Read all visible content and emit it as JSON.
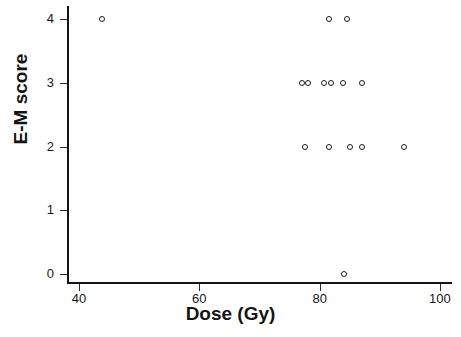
{
  "chart_data": {
    "type": "scatter",
    "title": "",
    "xlabel": "Dose (Gy)",
    "ylabel": "E-M score",
    "xlim": [
      38,
      102
    ],
    "ylim": [
      -0.12,
      4.2
    ],
    "xticks": [
      40,
      60,
      80,
      100
    ],
    "xtick_labels": [
      "40",
      "60",
      "80",
      "100"
    ],
    "yticks": [
      0,
      1,
      2,
      3,
      4
    ],
    "ytick_labels": [
      "0",
      "1",
      "2",
      "3",
      "4"
    ],
    "grid": false,
    "legend": null,
    "marker": "open-circle",
    "marker_color": "#1b1b1b",
    "points": [
      {
        "x": 43.9,
        "y": 4
      },
      {
        "x": 81.5,
        "y": 4
      },
      {
        "x": 84.5,
        "y": 4
      },
      {
        "x": 77.0,
        "y": 3
      },
      {
        "x": 78.1,
        "y": 3
      },
      {
        "x": 80.8,
        "y": 3
      },
      {
        "x": 81.9,
        "y": 3
      },
      {
        "x": 83.8,
        "y": 3
      },
      {
        "x": 87.1,
        "y": 3
      },
      {
        "x": 77.5,
        "y": 2
      },
      {
        "x": 81.5,
        "y": 2
      },
      {
        "x": 85.0,
        "y": 2
      },
      {
        "x": 87.0,
        "y": 2
      },
      {
        "x": 94.0,
        "y": 2
      },
      {
        "x": 84.0,
        "y": 0
      }
    ]
  }
}
